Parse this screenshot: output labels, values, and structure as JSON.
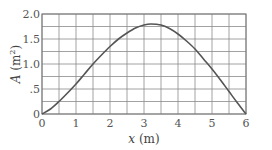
{
  "chart_data": {
    "type": "line",
    "title": "",
    "xlabel": "x (m)",
    "ylabel": "A (m²)",
    "xlim": [
      0,
      6
    ],
    "ylim": [
      0,
      2.0
    ],
    "grid": true,
    "x_grid_step": 0.5,
    "y_grid_step": 0.25,
    "x_ticks": [
      0,
      1,
      2,
      3,
      4,
      5,
      6
    ],
    "x_tick_labels": [
      "0",
      "1",
      "2",
      "3",
      "4",
      "5",
      "6"
    ],
    "y_ticks": [
      0,
      0.5,
      1.0,
      1.5,
      2.0
    ],
    "y_tick_labels": [
      "0",
      ".5",
      "1.0",
      "1.5",
      "2.0"
    ],
    "series": [
      {
        "name": "A(x)",
        "x": [
          0,
          0.25,
          0.5,
          0.75,
          1.0,
          1.25,
          1.5,
          1.75,
          2.0,
          2.25,
          2.5,
          2.75,
          3.0,
          3.2,
          3.5,
          3.75,
          4.0,
          4.25,
          4.5,
          4.75,
          5.0,
          5.25,
          5.5,
          5.75,
          6.0
        ],
        "values": [
          0,
          0.1,
          0.25,
          0.42,
          0.6,
          0.8,
          1.0,
          1.18,
          1.35,
          1.5,
          1.62,
          1.72,
          1.78,
          1.8,
          1.78,
          1.71,
          1.6,
          1.46,
          1.3,
          1.1,
          0.9,
          0.68,
          0.45,
          0.22,
          0
        ],
        "color": "#555555"
      }
    ]
  },
  "labels": {
    "xlabel_var": "x",
    "xlabel_unit": " (m)",
    "ylabel_var": "A",
    "ylabel_unit_open": " (m",
    "ylabel_unit_sup": "2",
    "ylabel_unit_close": ")"
  }
}
